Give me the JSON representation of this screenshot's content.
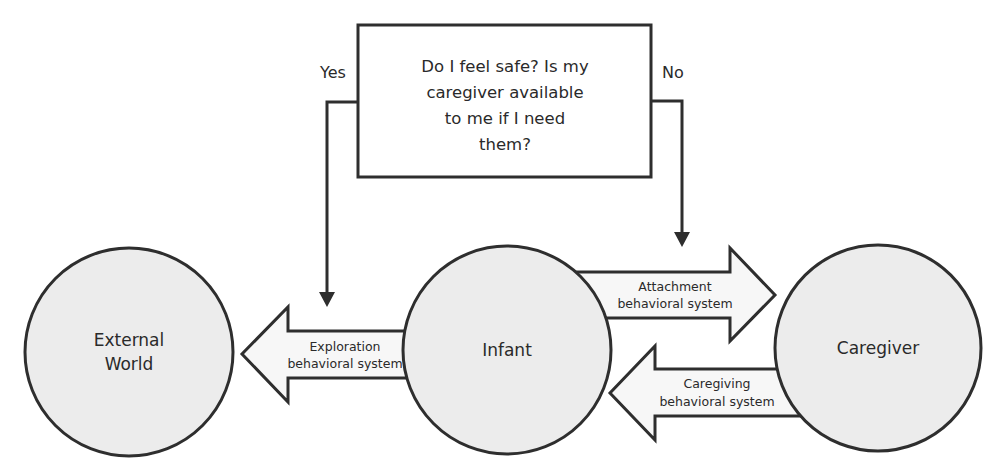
{
  "colors": {
    "stroke": "#2e2e2e",
    "circle_fill": "#ececec",
    "arrow_fill": "#f7f7f7",
    "box_fill": "#ffffff",
    "text": "#2a2a2a"
  },
  "decision_box": {
    "lines": [
      "Do I feel safe? Is my",
      "caregiver available",
      "to me if I need",
      "them?"
    ]
  },
  "branches": {
    "yes_label": "Yes",
    "no_label": "No"
  },
  "nodes": {
    "external_world": {
      "lines": [
        "External",
        "World"
      ]
    },
    "infant": {
      "label": "Infant"
    },
    "caregiver": {
      "label": "Caregiver"
    }
  },
  "arrows": {
    "exploration": {
      "lines": [
        "Exploration",
        "behavioral system"
      ]
    },
    "attachment": {
      "lines": [
        "Attachment",
        "behavioral system"
      ]
    },
    "caregiving": {
      "lines": [
        "Caregiving",
        "behavioral system"
      ]
    }
  }
}
